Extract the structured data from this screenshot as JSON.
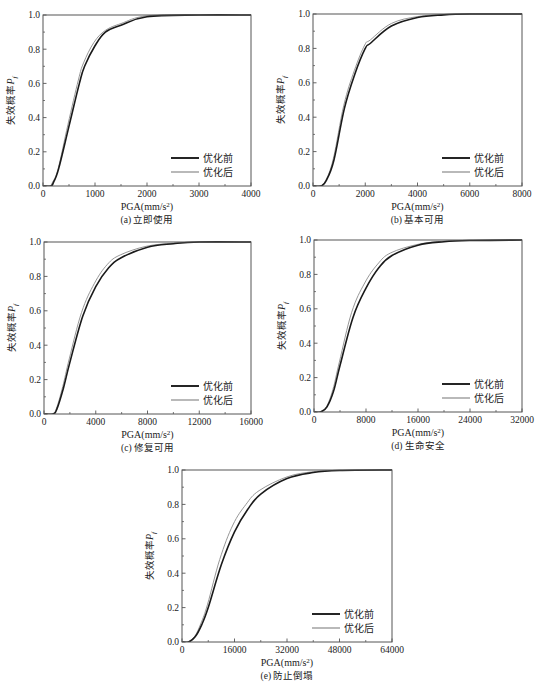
{
  "figure": {
    "ylabel_text": "失效概率",
    "ylabel_symbol": "P",
    "ylabel_subscript": "f",
    "xlabel_prefix": "PGA(mm/s",
    "xlabel_sup": "2",
    "xlabel_suffix": ")",
    "legend": [
      {
        "label": "优化前",
        "color": "#1a1a1a",
        "width": 1.6
      },
      {
        "label": "优化后",
        "color": "#8a8a8a",
        "width": 0.9
      }
    ]
  },
  "chart_data": [
    {
      "type": "line",
      "id": "a",
      "caption": "(a) 立即使用",
      "xlabel": "PGA(mm/s²)",
      "ylabel": "失效概率Pf",
      "xlim": [
        0,
        4000
      ],
      "ylim": [
        0,
        1.0
      ],
      "xticks": [
        0,
        1000,
        2000,
        3000,
        4000
      ],
      "yticks": [
        0.0,
        0.2,
        0.4,
        0.6,
        0.8,
        1.0
      ],
      "grid": false,
      "legend_position": "lower right",
      "box": {
        "left": 43,
        "top": 15,
        "right": 251,
        "bottom": 186
      },
      "series": [
        {
          "name": "优化前",
          "x": [
            0,
            150,
            200,
            300,
            500,
            700,
            800,
            1000,
            1200,
            1500,
            2000,
            3000,
            4000
          ],
          "y": [
            0,
            0,
            0.02,
            0.1,
            0.35,
            0.6,
            0.7,
            0.82,
            0.9,
            0.94,
            0.99,
            1.0,
            1.0
          ]
        },
        {
          "name": "优化后",
          "x": [
            0,
            130,
            180,
            290,
            480,
            680,
            780,
            980,
            1200,
            1500,
            2000,
            3000,
            4000
          ],
          "y": [
            0,
            0,
            0.02,
            0.1,
            0.36,
            0.62,
            0.72,
            0.84,
            0.91,
            0.95,
            0.995,
            1.0,
            1.0
          ]
        }
      ]
    },
    {
      "type": "line",
      "id": "b",
      "caption": "(b) 基本可用",
      "xlabel": "PGA(mm/s²)",
      "ylabel": "失效概率Pf",
      "xlim": [
        0,
        8000
      ],
      "ylim": [
        0,
        1.0
      ],
      "xticks": [
        0,
        2000,
        4000,
        6000,
        8000
      ],
      "yticks": [
        0.0,
        0.2,
        0.4,
        0.6,
        0.8,
        1.0
      ],
      "grid": false,
      "legend_position": "lower right",
      "box": {
        "left": 313,
        "top": 14,
        "right": 522,
        "bottom": 186
      },
      "series": [
        {
          "name": "优化前",
          "x": [
            0,
            300,
            500,
            800,
            1200,
            1600,
            2000,
            2200,
            3000,
            4000,
            5000,
            6000,
            8000
          ],
          "y": [
            0,
            0,
            0.03,
            0.15,
            0.45,
            0.65,
            0.8,
            0.83,
            0.93,
            0.98,
            0.995,
            1.0,
            1.0
          ]
        },
        {
          "name": "优化后",
          "x": [
            0,
            280,
            480,
            780,
            1180,
            1580,
            1980,
            2200,
            3000,
            4000,
            5000,
            6000,
            8000
          ],
          "y": [
            0,
            0,
            0.03,
            0.16,
            0.47,
            0.67,
            0.82,
            0.85,
            0.945,
            0.985,
            0.997,
            1.0,
            1.0
          ]
        }
      ]
    },
    {
      "type": "line",
      "id": "c",
      "caption": "(c) 修复可用",
      "xlabel": "PGA(mm/s²)",
      "ylabel": "失效概率Pf",
      "xlim": [
        0,
        16000
      ],
      "ylim": [
        0,
        1.0
      ],
      "xticks": [
        0,
        4000,
        8000,
        12000,
        16000
      ],
      "yticks": [
        0.0,
        0.2,
        0.4,
        0.6,
        0.8,
        1.0
      ],
      "grid": false,
      "legend_position": "lower right",
      "box": {
        "left": 44,
        "top": 242,
        "right": 251,
        "bottom": 414
      },
      "series": [
        {
          "name": "优化前",
          "x": [
            0,
            700,
            1000,
            1500,
            2000,
            3000,
            4000,
            5000,
            6000,
            8000,
            10000,
            12000,
            16000
          ],
          "y": [
            0,
            0,
            0.03,
            0.15,
            0.3,
            0.57,
            0.74,
            0.85,
            0.91,
            0.97,
            0.99,
            1.0,
            1.0
          ]
        },
        {
          "name": "优化后",
          "x": [
            0,
            650,
            950,
            1450,
            1950,
            2900,
            3900,
            4900,
            5900,
            7900,
            10000,
            12000,
            16000
          ],
          "y": [
            0,
            0,
            0.03,
            0.16,
            0.32,
            0.59,
            0.76,
            0.87,
            0.925,
            0.975,
            0.993,
            1.0,
            1.0
          ]
        }
      ]
    },
    {
      "type": "line",
      "id": "d",
      "caption": "(d) 生命安全",
      "xlabel": "PGA(mm/s²)",
      "ylabel": "失效概率Pf",
      "xlim": [
        0,
        32000
      ],
      "ylim": [
        0,
        1.0
      ],
      "xticks": [
        0,
        8000,
        16000,
        24000,
        32000
      ],
      "yticks": [
        0.0,
        0.2,
        0.4,
        0.6,
        0.8,
        1.0
      ],
      "grid": false,
      "legend_position": "lower right",
      "box": {
        "left": 314,
        "top": 240,
        "right": 522,
        "bottom": 412
      },
      "series": [
        {
          "name": "优化前",
          "x": [
            0,
            1000,
            2000,
            3000,
            4000,
            6000,
            8000,
            10000,
            12000,
            16000,
            20000,
            24000,
            32000
          ],
          "y": [
            0,
            0,
            0.03,
            0.12,
            0.27,
            0.55,
            0.72,
            0.84,
            0.91,
            0.97,
            0.99,
            0.997,
            1.0
          ]
        },
        {
          "name": "优化后",
          "x": [
            0,
            900,
            1900,
            2900,
            3900,
            5800,
            7800,
            9800,
            11800,
            16000,
            20000,
            24000,
            32000
          ],
          "y": [
            0,
            0,
            0.03,
            0.13,
            0.29,
            0.58,
            0.75,
            0.86,
            0.925,
            0.975,
            0.993,
            0.998,
            1.0
          ]
        }
      ]
    },
    {
      "type": "line",
      "id": "e",
      "caption": "(e) 防止倒塌",
      "xlabel": "PGA(mm/s²)",
      "ylabel": "失效概率Pf",
      "xlim": [
        0,
        64000
      ],
      "ylim": [
        0,
        1.0
      ],
      "xticks": [
        0,
        16000,
        32000,
        48000,
        64000
      ],
      "yticks": [
        0.0,
        0.2,
        0.4,
        0.6,
        0.8,
        1.0
      ],
      "grid": false,
      "legend_position": "lower right",
      "box": {
        "left": 182,
        "top": 470,
        "right": 392,
        "bottom": 642
      },
      "series": [
        {
          "name": "优化前",
          "x": [
            0,
            2000,
            4000,
            6000,
            8000,
            12000,
            16000,
            20000,
            24000,
            32000,
            40000,
            48000,
            64000
          ],
          "y": [
            0,
            0,
            0.03,
            0.1,
            0.2,
            0.45,
            0.64,
            0.77,
            0.86,
            0.95,
            0.985,
            0.997,
            1.0
          ]
        },
        {
          "name": "优化后",
          "x": [
            0,
            1800,
            3800,
            5800,
            7800,
            11500,
            15500,
            19500,
            23500,
            32000,
            40000,
            48000,
            64000
          ],
          "y": [
            0,
            0,
            0.03,
            0.11,
            0.22,
            0.48,
            0.68,
            0.8,
            0.88,
            0.96,
            0.99,
            0.998,
            1.0
          ]
        }
      ]
    }
  ]
}
